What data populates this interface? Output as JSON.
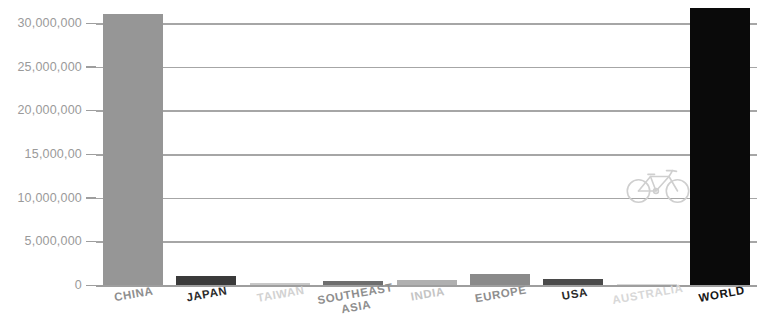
{
  "chart_data": {
    "type": "bar",
    "title": "",
    "subtitle": "",
    "xlabel": "",
    "ylabel": "",
    "categories": [
      "CHINA",
      "JAPAN",
      "TAIWAN",
      "SOUTHEAST\nASIA",
      "INDIA",
      "EUROPE",
      "USA",
      "AUSTRALIA",
      "WORLD"
    ],
    "values": [
      31000000,
      1050000,
      250000,
      500000,
      520000,
      1300000,
      700000,
      60000,
      31700000
    ],
    "bar_colors": [
      "#969696",
      "#3a3a3a",
      "#c8c8c8",
      "#6e6e6e",
      "#b0b0b0",
      "#8a8a8a",
      "#4a4a4a",
      "#d8d8d8",
      "#0a0a0a"
    ],
    "label_colors": [
      "#8e8e8e",
      "#2b2b2b",
      "#d2d2d2",
      "#8e8e8e",
      "#c4c4c4",
      "#8e8e8e",
      "#2b2b2b",
      "#d8d8d8",
      "#151515"
    ],
    "ylim": [
      0,
      34000000
    ],
    "yticks": [
      0,
      5000000,
      10000000,
      15000000,
      20000000,
      25000000,
      30000000
    ],
    "ytick_labels": [
      "0",
      "5,000,000",
      "10,000,000",
      "15,000,00",
      "20,000,000",
      "25,000,000",
      "30,000,000"
    ],
    "grid": true,
    "grid_axis": "y",
    "legend": false,
    "annotations": [
      {
        "name": "bicycle-icon",
        "label": "bicycle",
        "x_frac": 0.705,
        "y_value": 11500000
      }
    ],
    "axis_color": "#9e9e9e",
    "grid_color": "#a6a6a6",
    "background": "#ffffff"
  }
}
